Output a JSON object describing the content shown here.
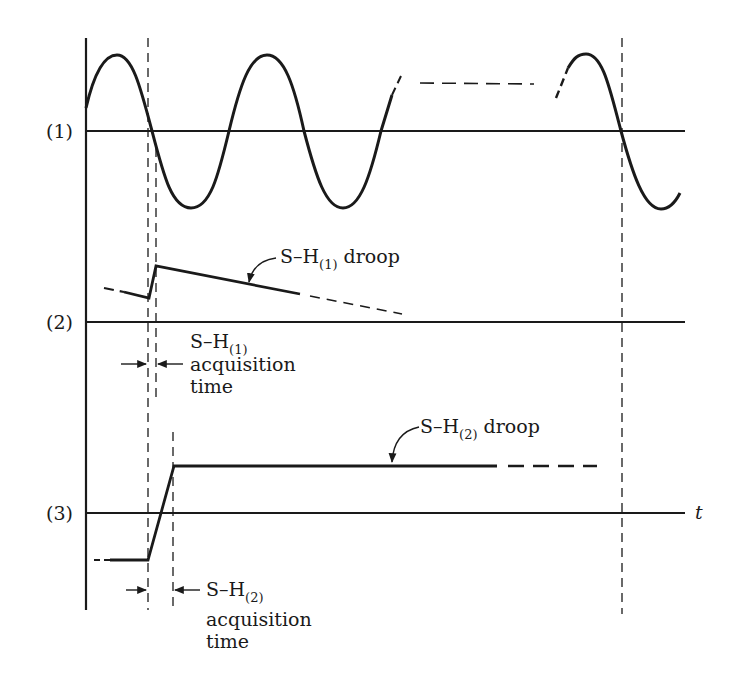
{
  "diagram": {
    "type": "timing-waveform",
    "colors": {
      "ink": "#1a1a1a",
      "background": "#ffffff"
    },
    "traces": [
      {
        "id": "1",
        "label": "(1)",
        "description": "sinusoidal input signal"
      },
      {
        "id": "2",
        "label": "(2)",
        "description": "first sample-and-hold output"
      },
      {
        "id": "3",
        "label": "(3)",
        "description": "second sample-and-hold output"
      }
    ],
    "time_axis_label": "t",
    "annotations": {
      "sh1_droop": {
        "prefix": "S–H",
        "subscript": "(1)",
        "suffix": " droop"
      },
      "sh2_droop": {
        "prefix": "S–H",
        "subscript": "(2)",
        "suffix": " droop"
      },
      "sh1_acq": {
        "prefix": "S–H",
        "subscript": "(1)",
        "line2": "acquisition",
        "line3": "time"
      },
      "sh2_acq": {
        "prefix": "S–H",
        "subscript": "(2)",
        "line2": "acquisition",
        "line3": "time"
      }
    }
  }
}
